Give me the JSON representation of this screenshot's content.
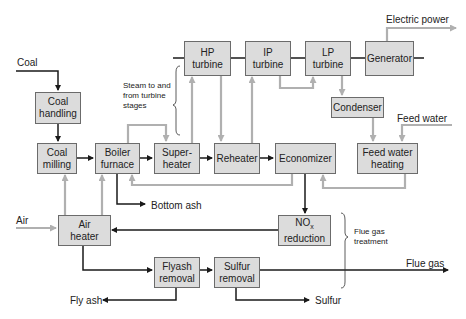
{
  "diagram": {
    "type": "process-flow"
  },
  "boxes": {
    "coal_handling": "Coal\nhandling",
    "coal_milling": "Coal\nmilling",
    "boiler_furnace": "Boiler\nfurnace",
    "superheater": "Super-\nheater",
    "reheater": "Reheater",
    "economizer": "Economizer",
    "feed_water_heating": "Feed water\nheating",
    "hp_turbine": "HP\nturbine",
    "ip_turbine": "IP\nturbine",
    "lp_turbine": "LP\nturbine",
    "generator": "Generator",
    "condenser": "Condenser",
    "nox_reduction_main": "NO",
    "nox_reduction_sub": "x",
    "nox_reduction_rest": "reduction",
    "air_heater": "Air\nheater",
    "flyash_removal": "Flyash\nremoval",
    "sulfur_removal": "Sulfur\nremoval"
  },
  "labels": {
    "coal": "Coal",
    "air": "Air",
    "electric_power": "Electric power",
    "feed_water": "Feed water",
    "steam_note": "Steam to and\nfrom turbine\nstages",
    "bottom_ash": "Bottom ash",
    "flue_gas_treatment": "Flue gas\ntreatment",
    "flue_gas": "Flue gas",
    "fly_ash": "Fly ash",
    "sulfur": "Sulfur"
  },
  "colors": {
    "box_fill": "#dcdcdc",
    "box_border": "#6b6b6b",
    "dark_flow": "#1a1a1a",
    "light_flow": "#b0b0b0"
  }
}
